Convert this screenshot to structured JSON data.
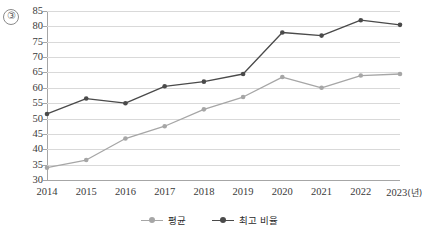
{
  "figure": {
    "marker_label": "③"
  },
  "chart_data": {
    "type": "line",
    "title": "",
    "subtitle": "",
    "xlabel": "년",
    "ylabel": "",
    "x_unit_note": "(년)",
    "categories": [
      "2014",
      "2015",
      "2016",
      "2017",
      "2018",
      "2019",
      "2020",
      "2021",
      "2022",
      "2023"
    ],
    "series": [
      {
        "name": "평균",
        "color": "#a6a6a6",
        "marker": "circle",
        "values": [
          34,
          36.5,
          43.5,
          47.5,
          53,
          57,
          63.5,
          60,
          64,
          64.5
        ]
      },
      {
        "name": "최고 비율",
        "color": "#4a4a4a",
        "marker": "circle",
        "values": [
          51.5,
          56.5,
          55,
          60.5,
          62,
          64.5,
          78,
          77,
          82,
          80.5
        ]
      }
    ],
    "ylim": [
      30,
      85
    ],
    "ytick_values": [
      85,
      80,
      75,
      70,
      65,
      60,
      55,
      50,
      45,
      40,
      35,
      30
    ],
    "ytick_labels": [
      "85",
      "80",
      "75",
      "70",
      "65",
      "60",
      "55",
      "50",
      "45",
      "40",
      "35",
      "30"
    ],
    "xtick_labels": [
      "2014",
      "2015",
      "2016",
      "2017",
      "2018",
      "2019",
      "2020",
      "2021",
      "2022",
      "2023"
    ],
    "grid": true,
    "grid_axis": "y",
    "legend_position": "bottom-center",
    "legend_entries": [
      "평균",
      "최고 비율"
    ]
  },
  "colors": {
    "series_average": "#a6a6a6",
    "series_highest": "#4a4a4a",
    "gridline": "#d9d9d9",
    "axis": "#a6a6a6",
    "text": "#3a3a3a",
    "background": "#ffffff"
  }
}
